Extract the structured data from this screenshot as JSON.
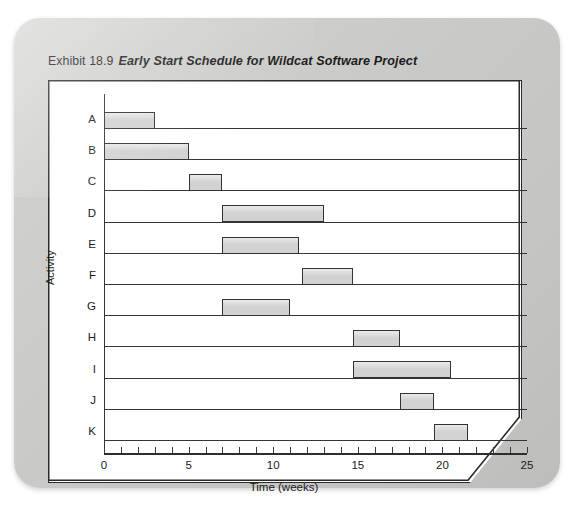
{
  "caption": {
    "exhibit_label": "Exhibit 18.9",
    "title": "Early Start Schedule for Wildcat Software Project"
  },
  "credit": "© Cengage Learning 2013",
  "chart_data": {
    "type": "bar",
    "orientation": "horizontal-gantt",
    "title": "Early Start Schedule for Wildcat Software Project",
    "xlabel": "Time (weeks)",
    "ylabel": "Activity",
    "xlim": [
      0,
      25
    ],
    "xticks": [
      0,
      1,
      2,
      3,
      4,
      5,
      6,
      7,
      8,
      9,
      10,
      11,
      12,
      13,
      14,
      15,
      16,
      17,
      18,
      19,
      20,
      21,
      22,
      23,
      24,
      25
    ],
    "xticklabels": [
      "0",
      "5",
      "10",
      "15",
      "20",
      "25"
    ],
    "xticklabel_values": [
      0,
      5,
      10,
      15,
      20,
      25
    ],
    "grid": false,
    "categories": [
      "A",
      "B",
      "C",
      "D",
      "E",
      "F",
      "G",
      "H",
      "I",
      "J",
      "K"
    ],
    "bar_color": "#d2d2d2",
    "bar_edge_color": "#333333",
    "tasks": [
      {
        "activity": "A",
        "start": 0,
        "end": 3,
        "duration": 3
      },
      {
        "activity": "B",
        "start": 0,
        "end": 5,
        "duration": 5
      },
      {
        "activity": "C",
        "start": 5,
        "end": 7,
        "duration": 2
      },
      {
        "activity": "D",
        "start": 7,
        "end": 13,
        "duration": 6
      },
      {
        "activity": "E",
        "start": 7,
        "end": 11.5,
        "duration": 4.5
      },
      {
        "activity": "F",
        "start": 11.7,
        "end": 14.7,
        "duration": 3
      },
      {
        "activity": "G",
        "start": 7,
        "end": 11,
        "duration": 4
      },
      {
        "activity": "H",
        "start": 14.7,
        "end": 17.5,
        "duration": 2.8
      },
      {
        "activity": "I",
        "start": 14.7,
        "end": 20.5,
        "duration": 5.8
      },
      {
        "activity": "J",
        "start": 17.5,
        "end": 19.5,
        "duration": 2
      },
      {
        "activity": "K",
        "start": 19.5,
        "end": 21.5,
        "duration": 2
      }
    ]
  }
}
